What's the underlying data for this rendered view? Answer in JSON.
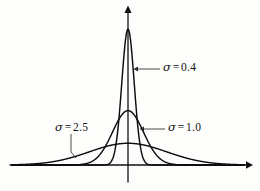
{
  "figure": {
    "background_color": "#fdfdfb",
    "ink_color": "#0d0d0d"
  },
  "axes": {
    "x_axis_name": "horizontal-axis",
    "y_axis_name": "vertical-axis",
    "x_axis_y_px": 165,
    "y_axis_x_px": 128,
    "x_axis_start_px": 10,
    "x_axis_end_px": 252,
    "y_axis_top_px": 6,
    "has_tick_labels": false,
    "has_axis_titles": false,
    "has_grid": false
  },
  "annotations": [
    {
      "id": "sigma-04",
      "symbol": "σ",
      "equals": "=",
      "value": "0.4",
      "full_text": "σ = 0.4",
      "leader_type": "arrow-left",
      "label_x_px": 163,
      "label_y_px": 62,
      "arrow_from_px": [
        160,
        69
      ],
      "arrow_to_px": [
        136,
        69
      ]
    },
    {
      "id": "sigma-25",
      "symbol": "σ",
      "equals": "=",
      "value": "2.5",
      "full_text": "σ = 2.5",
      "leader_type": "line-down",
      "label_x_px": 55,
      "label_y_px": 122,
      "arrow_from_px": [
        71,
        134
      ],
      "arrow_to_px": [
        71,
        156
      ]
    },
    {
      "id": "sigma-10",
      "symbol": "σ",
      "equals": "=",
      "value": "1.0",
      "full_text": "σ = 1.0",
      "leader_type": "arrow-left",
      "label_x_px": 168,
      "label_y_px": 122,
      "arrow_from_px": [
        165,
        129
      ],
      "arrow_to_px": [
        142,
        129
      ]
    }
  ],
  "chart_data": {
    "type": "line",
    "title": "",
    "xlabel": "",
    "ylabel": "",
    "grid": false,
    "legend_position": "inline-annotations",
    "x_center": 0,
    "x_range_units": [
      -7.5,
      7.5
    ],
    "series": [
      {
        "name": "σ = 0.4",
        "sigma": 0.4,
        "mean": 0,
        "peak_value": 0.9974,
        "peak_pixel_y": 28,
        "label": "σ = 0.4",
        "color": "#0d0d0d"
      },
      {
        "name": "σ = 1.0",
        "sigma": 1.0,
        "mean": 0,
        "peak_value": 0.3989,
        "peak_pixel_y": 107,
        "label": "σ = 1.0",
        "color": "#0d0d0d"
      },
      {
        "name": "σ = 2.5",
        "sigma": 2.5,
        "mean": 0,
        "peak_value": 0.1596,
        "peak_pixel_y": 143,
        "label": "σ = 2.5",
        "color": "#0d0d0d"
      }
    ],
    "ylim": [
      0,
      1.05
    ],
    "baseline_pixel_y": 165
  }
}
